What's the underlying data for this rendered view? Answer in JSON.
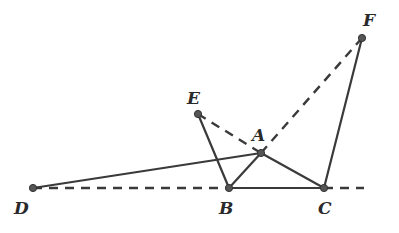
{
  "diagram": {
    "type": "geometry-figure",
    "points": {
      "D": {
        "label": "D",
        "x": 33,
        "y": 188,
        "lx": 14,
        "ly": 214
      },
      "B": {
        "label": "B",
        "x": 229,
        "y": 188,
        "lx": 219,
        "ly": 214
      },
      "C": {
        "label": "C",
        "x": 324,
        "y": 188,
        "lx": 318,
        "ly": 214
      },
      "A": {
        "label": "A",
        "x": 261,
        "y": 153,
        "lx": 252,
        "ly": 141
      },
      "E": {
        "label": "E",
        "x": 198,
        "y": 114,
        "lx": 187,
        "ly": 104
      },
      "F": {
        "label": "F",
        "x": 362,
        "y": 38,
        "lx": 363,
        "ly": 26
      }
    },
    "solid_segments": [
      [
        "D",
        "A"
      ],
      [
        "B",
        "A"
      ],
      [
        "A",
        "C"
      ],
      [
        "B",
        "C"
      ],
      [
        "E",
        "B"
      ],
      [
        "C",
        "F"
      ]
    ],
    "dashed_segments": [
      [
        "D",
        "B"
      ],
      [
        "E",
        "A"
      ],
      [
        "A",
        "F"
      ],
      [
        "C",
        "ext"
      ]
    ],
    "extension_point": {
      "x": 364,
      "y": 188
    },
    "colors": {
      "stroke": "#3a3a3a",
      "point_fill": "#555555",
      "background": "#ffffff"
    }
  }
}
